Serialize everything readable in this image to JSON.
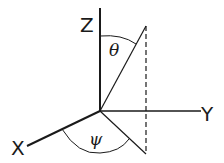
{
  "diagram": {
    "type": "3d-coordinate-axes",
    "axes": {
      "z": {
        "label": "Z"
      },
      "y": {
        "label": "Y"
      },
      "x": {
        "label": "X"
      }
    },
    "angles": {
      "polar": {
        "label": "θ",
        "between": "Z axis and vector"
      },
      "azimuth": {
        "label": "ψ",
        "between": "X axis and projection of vector onto XY plane"
      }
    },
    "elements": [
      "vector from origin",
      "dashed vertical drop line",
      "projection onto XY plane"
    ],
    "colors": {
      "stroke": "#1a1a1a",
      "background": "#ffffff"
    }
  }
}
